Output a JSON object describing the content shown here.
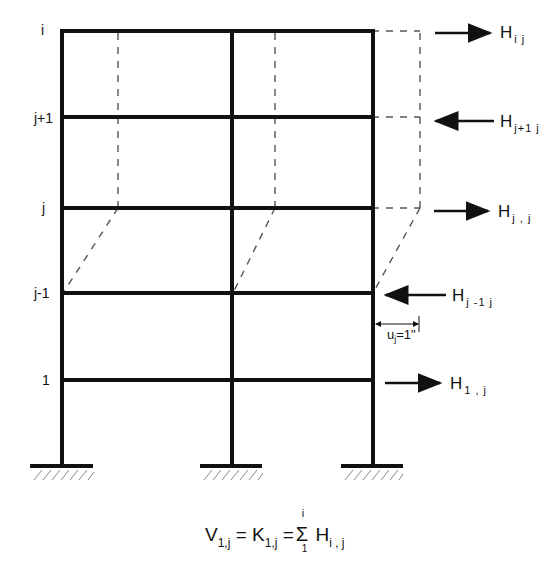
{
  "diagram": {
    "floor_labels": [
      "i",
      "j+1",
      "j",
      "j-1",
      "1"
    ],
    "forces": [
      {
        "floor": "i",
        "symbol": "H",
        "subscript": "i j",
        "direction": "right"
      },
      {
        "floor": "j+1",
        "symbol": "H",
        "subscript": "j+1 j",
        "direction": "left"
      },
      {
        "floor": "j",
        "symbol": "H",
        "subscript": "j , j",
        "direction": "right"
      },
      {
        "floor": "j-1",
        "symbol": "H",
        "subscript": "j -1 j",
        "direction": "left"
      },
      {
        "floor": "1",
        "symbol": "H",
        "subscript": "1 , j",
        "direction": "right"
      }
    ],
    "displacement": {
      "symbol": "u",
      "subscript": "j",
      "value": "=1\""
    },
    "formula": {
      "lhs": "V",
      "lhs_sub": "1,j",
      "eq1": " = ",
      "mid": "K",
      "mid_sub": "1,j",
      "eq2": " =",
      "sigma": "Σ",
      "sigma_upper": "i",
      "sigma_lower": "1",
      "rhs": "H",
      "rhs_sub": "i , j"
    },
    "supports": [
      "fixed-left",
      "fixed-middle",
      "fixed-right"
    ],
    "colors": {
      "line": "#111111",
      "dashed": "#555555",
      "background": "#ffffff"
    }
  }
}
